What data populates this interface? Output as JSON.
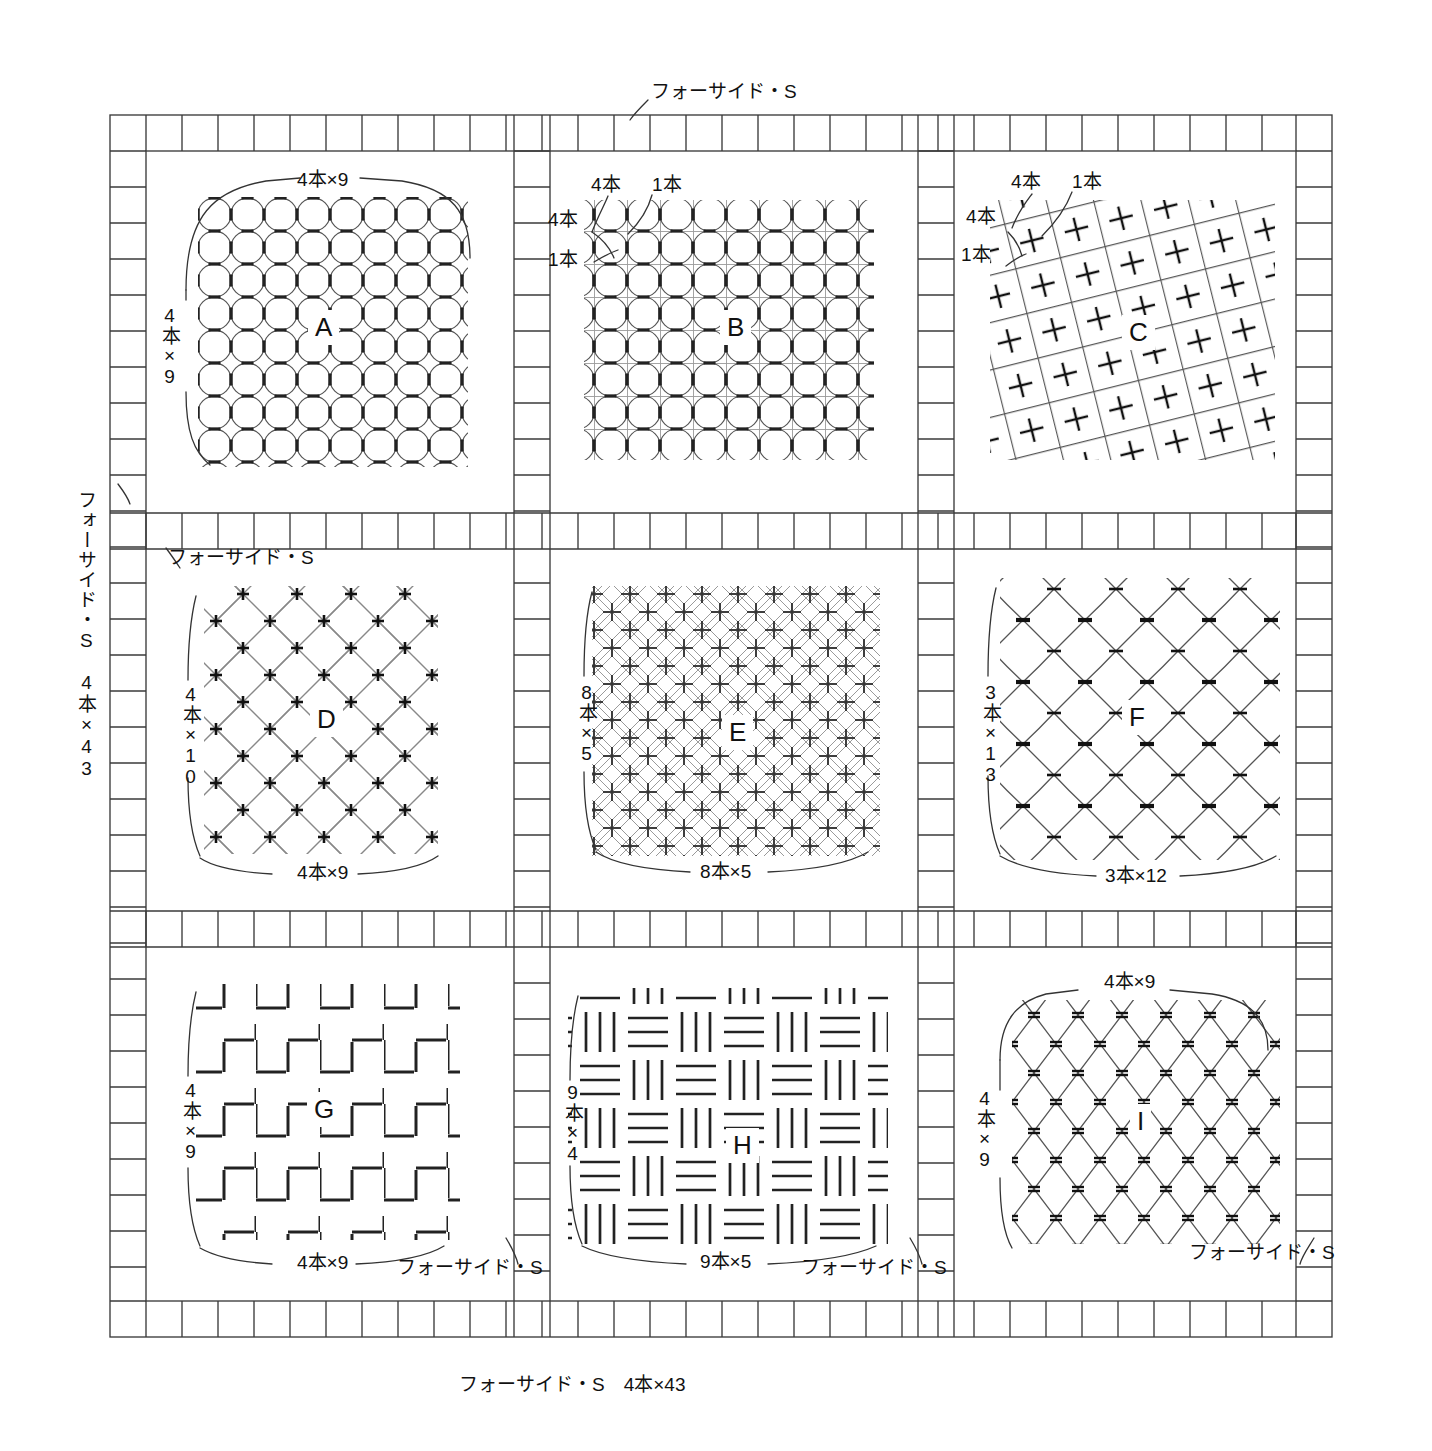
{
  "document": {
    "title": "刺し子パターン図 — フォーサイド・S",
    "sheet_width": 1432,
    "sheet_height": 1451,
    "ink_color": "#111111",
    "pattern_color": "#555555",
    "grid_color": "#444444",
    "background": "#ffffff"
  },
  "margins": {
    "top_label": "フォーサイド・S",
    "left_label": "フォーサイド・S　4本×43",
    "bottom_label": "フォーサイド・S　4本×43",
    "inner_label_row2_left": "フォーサイド・S",
    "inner_label_g_bottom": "フォーサイド・S",
    "inner_label_h_bottom": "フォーサイド・S",
    "inner_label_i_bottom": "フォーサイド・S"
  },
  "panels": [
    {
      "id": "A",
      "letter": "A",
      "motif": "shippou-overlapping-circles",
      "row": 1,
      "col": 1,
      "top_label": "4本×9",
      "left_label": "4本×9",
      "bottom_label": "",
      "extra_labels": []
    },
    {
      "id": "B",
      "letter": "B",
      "motif": "shippou-on-grid",
      "row": 1,
      "col": 2,
      "top_label": "",
      "left_label": "",
      "bottom_label": "",
      "extra_labels": [
        "4本",
        "1本",
        "4本",
        "1本"
      ]
    },
    {
      "id": "C",
      "letter": "C",
      "motif": "diagonal-lattice-with-crosses",
      "row": 1,
      "col": 3,
      "top_label": "",
      "left_label": "",
      "bottom_label": "",
      "extra_labels": [
        "4本",
        "1本",
        "4本",
        "1本"
      ]
    },
    {
      "id": "D",
      "letter": "D",
      "motif": "diagonal-leaf-lattice-with-crosses",
      "row": 2,
      "col": 1,
      "top_label": "",
      "left_label": "4本×10",
      "bottom_label": "4本×9",
      "extra_labels": []
    },
    {
      "id": "E",
      "letter": "E",
      "motif": "double-diagonal-lattice-with-crosses",
      "row": 2,
      "col": 2,
      "top_label": "",
      "left_label": "8本×5",
      "bottom_label": "8本×5",
      "extra_labels": []
    },
    {
      "id": "F",
      "letter": "F",
      "motif": "diamond-net-with-ticks",
      "row": 2,
      "col": 3,
      "top_label": "",
      "left_label": "3本×13",
      "bottom_label": "3本×12",
      "extra_labels": []
    },
    {
      "id": "G",
      "letter": "G",
      "motif": "stepped-zigzag-dashes",
      "row": 3,
      "col": 1,
      "top_label": "",
      "left_label": "4本×9",
      "bottom_label": "4本×9",
      "extra_labels": []
    },
    {
      "id": "H",
      "letter": "H",
      "motif": "basket-weave-bars",
      "row": 3,
      "col": 2,
      "top_label": "",
      "left_label": "9本×4",
      "bottom_label": "9本×5",
      "extra_labels": []
    },
    {
      "id": "I",
      "letter": "I",
      "motif": "vertical-diamond-net",
      "row": 3,
      "col": 3,
      "top_label": "4本×9",
      "left_label": "4本×9",
      "bottom_label": "",
      "extra_labels": []
    }
  ],
  "panel_sublabels": {
    "b_top_4": "4本",
    "b_top_1": "1本",
    "b_left_4": "4本",
    "b_left_1": "1本",
    "c_top_4": "4本",
    "c_top_1": "1本",
    "c_left_4": "4本",
    "c_left_1": "1本"
  }
}
